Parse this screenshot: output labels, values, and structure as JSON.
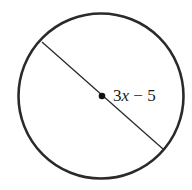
{
  "diagram": {
    "shape": "circle",
    "segment": "diameter",
    "center_point": "center",
    "label": "3x − 5",
    "label_parts": {
      "coef": "3",
      "var": "x",
      "rest": " − 5"
    },
    "colors": {
      "stroke": "#2a2a2a",
      "background": "#ffffff"
    }
  }
}
